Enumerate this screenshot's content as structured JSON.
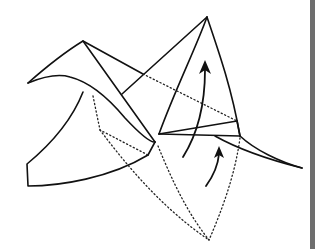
{
  "figure": {
    "title": "Origami fold diagram",
    "colors": {
      "line": "#111111",
      "background": "#ffffff",
      "side_bar": "#6e6e6e"
    },
    "arrows": [
      {
        "name": "large-fold-up-arrow",
        "direction": "up"
      },
      {
        "name": "small-fold-up-arrow",
        "direction": "up"
      }
    ]
  }
}
